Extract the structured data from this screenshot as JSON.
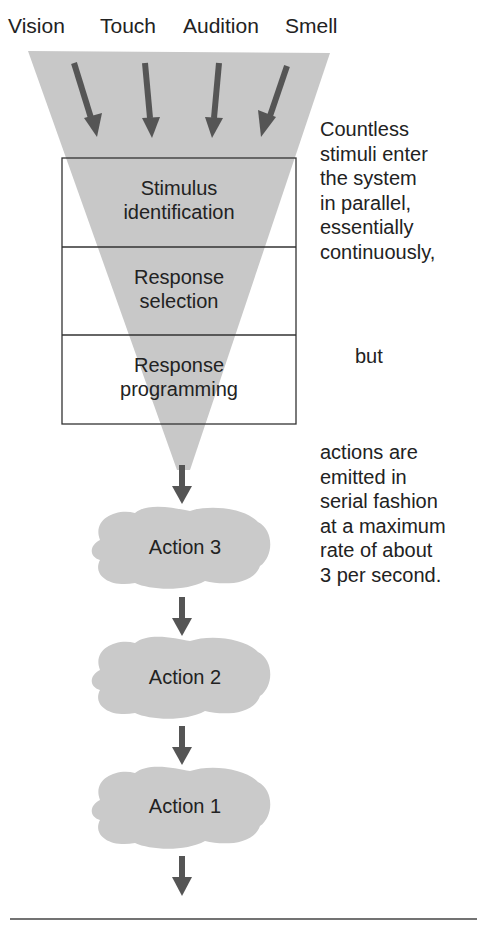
{
  "inputs": [
    {
      "label": "Vision"
    },
    {
      "label": "Touch"
    },
    {
      "label": "Audition"
    },
    {
      "label": "Smell"
    }
  ],
  "stages": [
    {
      "line1": "Stimulus",
      "line2": "identification"
    },
    {
      "line1": "Response",
      "line2": "selection"
    },
    {
      "line1": "Response",
      "line2": "programming"
    }
  ],
  "annotations": {
    "parallel": [
      "Countless",
      "stimuli enter",
      "the system",
      "in parallel,",
      "essentially",
      "continuously,"
    ],
    "but": "but",
    "serial": [
      "actions are",
      "emitted in",
      "serial fashion",
      "at a maximum",
      "rate of about",
      "3 per second."
    ]
  },
  "actions": [
    {
      "label": "Action 3"
    },
    {
      "label": "Action 2"
    },
    {
      "label": "Action 1"
    }
  ],
  "colors": {
    "funnel": "#c8c8c8",
    "arrow": "#555555",
    "cloud": "#cacaca",
    "text": "#222222",
    "border": "#333333"
  }
}
